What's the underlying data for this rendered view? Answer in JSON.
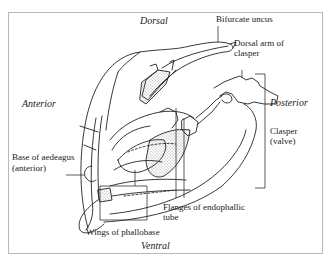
{
  "figure": {
    "type": "anatomical-line-drawing"
  },
  "orientation": {
    "dorsal": "Dorsal",
    "ventral": "Ventral",
    "anterior": "Anterior",
    "posterior": "Posterior"
  },
  "labels": {
    "bifurcate_uncus": "Bifurcate uncus",
    "dorsal_arm_line1": "Dorsal arm of",
    "dorsal_arm_line2": "clasper",
    "clasper_line1": "Clasper",
    "clasper_line2": "(valve)",
    "base_aedeagus_line1": "Base of aedeagus",
    "base_aedeagus_line2": "(anterior)",
    "flanges_line1": "Flanges of endophallic",
    "flanges_line2": "tube",
    "wings_phallobase": "Wings of phallobase"
  },
  "colors": {
    "ink": "#222222",
    "frame": "#b8b8b8",
    "background": "#ffffff"
  }
}
